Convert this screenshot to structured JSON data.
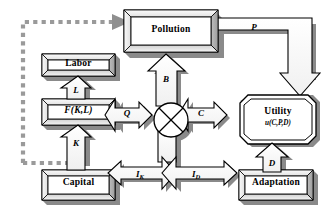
{
  "diagram": {
    "type": "block-flow-diagram",
    "colors": {
      "fill": "#ffffff",
      "outline": "#000000",
      "bevel_light": "#f2f2f2",
      "bevel_mid": "#c9c9c9",
      "bevel_dark": "#8c8c8c",
      "shadow": "#808080",
      "dashed_feedback": "#9a9a9a"
    },
    "nodes": [
      {
        "id": "pollution",
        "label": "Pollution",
        "shape": "box"
      },
      {
        "id": "labor",
        "label": "Labor",
        "shape": "box"
      },
      {
        "id": "production",
        "label": "F(K,L)",
        "shape": "box"
      },
      {
        "id": "capital",
        "label": "Capital",
        "shape": "box"
      },
      {
        "id": "adaptation",
        "label": "Adaptation",
        "shape": "box"
      },
      {
        "id": "splitter",
        "label": "",
        "shape": "circle-cross"
      },
      {
        "id": "utility",
        "label": "Utility",
        "sublabel": "u(C,P,D)",
        "shape": "octagon"
      }
    ],
    "flows": [
      {
        "id": "L",
        "label": "L",
        "sub": "",
        "from": "labor",
        "to": "production",
        "direction": "down"
      },
      {
        "id": "K",
        "label": "K",
        "sub": "",
        "from": "capital",
        "to": "production",
        "direction": "up"
      },
      {
        "id": "Q",
        "label": "Q",
        "sub": "",
        "from": "production",
        "to": "splitter",
        "direction": "right"
      },
      {
        "id": "B",
        "label": "B",
        "sub": "",
        "from": "splitter",
        "to": "pollution",
        "direction": "up"
      },
      {
        "id": "C",
        "label": "C",
        "sub": "",
        "from": "splitter",
        "to": "utility",
        "direction": "right"
      },
      {
        "id": "P",
        "label": "P",
        "sub": "",
        "from": "pollution",
        "to": "utility",
        "direction": "right-down"
      },
      {
        "id": "IK",
        "label": "I",
        "sub": "K",
        "from": "splitter",
        "to": "capital",
        "direction": "down-left"
      },
      {
        "id": "ID",
        "label": "I",
        "sub": "D",
        "from": "splitter",
        "to": "adaptation",
        "direction": "down-right"
      },
      {
        "id": "D",
        "label": "D",
        "sub": "",
        "from": "adaptation",
        "to": "utility",
        "direction": "up"
      }
    ],
    "feedback": {
      "id": "pollution-feedback",
      "style": "dashed",
      "from": "capital-row",
      "to": "pollution",
      "label": ""
    }
  }
}
